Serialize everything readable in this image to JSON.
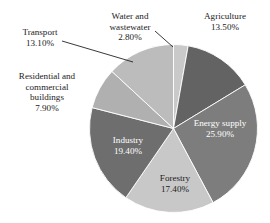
{
  "chart_data": {
    "type": "pie",
    "title": "",
    "legend_position": "none",
    "grid": false,
    "start_angle_deg": 0,
    "direction": "clockwise",
    "categories": [
      "Water and wastewater",
      "Agriculture",
      "Energy supply",
      "Forestry",
      "Industry",
      "Residential and commercial buildings",
      "Transport"
    ],
    "values": [
      2.8,
      13.5,
      25.9,
      17.4,
      19.4,
      7.9,
      13.1
    ],
    "value_unit": "%",
    "slices": [
      {
        "label": "Water and wastewater",
        "label_lines": [
          "Water and",
          "wastewater"
        ],
        "value": 2.8,
        "value_text": "2.80%",
        "color": "#c9c9c9",
        "label_placement": "outside",
        "leader": true,
        "text_color": "#1b1b1b"
      },
      {
        "label": "Agriculture",
        "label_lines": [
          "Agriculture"
        ],
        "value": 13.5,
        "value_text": "13.50%",
        "color": "#636363",
        "label_placement": "outside",
        "leader": false,
        "text_color": "#1b1b1b"
      },
      {
        "label": "Energy supply",
        "label_lines": [
          "Energy supply"
        ],
        "value": 25.9,
        "value_text": "25.90%",
        "color": "#7d7d7d",
        "label_placement": "inside",
        "leader": false,
        "text_color": "#ffffff"
      },
      {
        "label": "Forestry",
        "label_lines": [
          "Forestry"
        ],
        "value": 17.4,
        "value_text": "17.40%",
        "color": "#c8c8c8",
        "label_placement": "inside",
        "leader": false,
        "text_color": "#1b1b1b"
      },
      {
        "label": "Industry",
        "label_lines": [
          "Industry"
        ],
        "value": 19.4,
        "value_text": "19.40%",
        "color": "#6e6e6e",
        "label_placement": "inside",
        "leader": false,
        "text_color": "#ffffff"
      },
      {
        "label": "Residential and commercial buildings",
        "label_lines": [
          "Residential and",
          "commercial",
          "buildings"
        ],
        "value": 7.9,
        "value_text": "7.90%",
        "color": "#b0b0b0",
        "label_placement": "outside",
        "leader": false,
        "text_color": "#1b1b1b"
      },
      {
        "label": "Transport",
        "label_lines": [
          "Transport"
        ],
        "value": 13.1,
        "value_text": "13.10%",
        "color": "#bcbcbc",
        "label_placement": "outside",
        "leader": true,
        "text_color": "#1b1b1b"
      }
    ]
  },
  "labels": {
    "agriculture": {
      "line1": "Agriculture",
      "value": "13.50%"
    },
    "water": {
      "line1": "Water and",
      "line2": "wastewater",
      "value": "2.80%"
    },
    "transport": {
      "line1": "Transport",
      "value": "13.10%"
    },
    "residential": {
      "line1": "Residential and",
      "line2": "commercial",
      "line3": "buildings",
      "value": "7.90%"
    },
    "energy": {
      "line1": "Energy supply",
      "value": "25.90%"
    },
    "forestry": {
      "line1": "Forestry",
      "value": "17.40%"
    },
    "industry": {
      "line1": "Industry",
      "value": "19.40%"
    }
  }
}
